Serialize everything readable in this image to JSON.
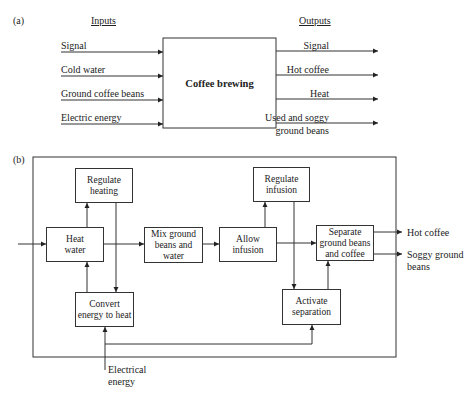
{
  "part_a": {
    "label": "(a)",
    "inputs_header": "Inputs",
    "outputs_header": "Outputs",
    "process": "Coffee brewing",
    "inputs": [
      "Signal",
      "Cold water",
      "Ground coffee beans",
      "Electric energy"
    ],
    "outputs": [
      "Signal",
      "Hot coffee",
      "Heat",
      "Used and soggy",
      "ground beans"
    ]
  },
  "part_b": {
    "label": "(b)",
    "boxes": {
      "regulate_heating": [
        "Regulate",
        "heating"
      ],
      "heat_water": [
        "Heat",
        "water"
      ],
      "mix": [
        "Mix ground",
        "beans and",
        "water"
      ],
      "allow_infusion": [
        "Allow",
        "infusion"
      ],
      "regulate_infusion": [
        "Regulate",
        "infusion"
      ],
      "separate": [
        "Separate",
        "ground beans",
        "and coffee"
      ],
      "convert_energy": [
        "Convert",
        "energy to heat"
      ],
      "activate_separation": [
        "Activate",
        "separation"
      ]
    },
    "outputs": {
      "hot_coffee": "Hot coffee",
      "soggy_1": "Soggy ground",
      "soggy_2": "beans"
    },
    "input": {
      "electrical_1": "Electrical",
      "electrical_2": "energy"
    }
  }
}
